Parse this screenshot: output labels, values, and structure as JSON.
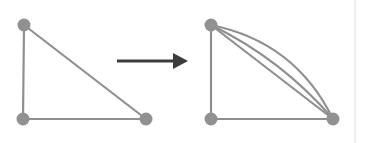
{
  "figure": {
    "background_color": "#ffffff",
    "width": 370,
    "height": 143,
    "edge_color": "#8f8f8f",
    "node_color": "#919191",
    "arrow_color": "#3c3c3c",
    "divider_color": "#f0f0f0",
    "edge_width": 2.2,
    "node_radius": 6.5
  },
  "chart_data": {
    "type": "diagram",
    "panels": [
      {
        "name": "left-graph",
        "label": "simple triangle graph",
        "nodes": [
          {
            "id": "A",
            "name": "top-left-node",
            "x": 24,
            "y": 25,
            "r": 6.5
          },
          {
            "id": "B",
            "name": "bottom-left-node",
            "x": 23,
            "y": 119,
            "r": 6.5
          },
          {
            "id": "C",
            "name": "bottom-right-node",
            "x": 146,
            "y": 119,
            "r": 6.5
          }
        ],
        "edges": [
          {
            "name": "edge-A-B",
            "from": "A",
            "to": "B",
            "kind": "straight",
            "curvature": 0
          },
          {
            "name": "edge-B-C",
            "from": "B",
            "to": "C",
            "kind": "straight",
            "curvature": 0
          },
          {
            "name": "edge-A-C",
            "from": "A",
            "to": "C",
            "kind": "straight",
            "curvature": 0
          }
        ]
      },
      {
        "name": "right-graph",
        "label": "multigraph with three parallel A-C edges",
        "nodes": [
          {
            "id": "A",
            "name": "top-left-node",
            "x": 211,
            "y": 25,
            "r": 6.5
          },
          {
            "id": "B",
            "name": "bottom-left-node",
            "x": 211,
            "y": 119,
            "r": 6.5
          },
          {
            "id": "C",
            "name": "bottom-right-node",
            "x": 333,
            "y": 119,
            "r": 6.5
          }
        ],
        "edges": [
          {
            "name": "edge-A-B",
            "from": "A",
            "to": "B",
            "kind": "straight",
            "curvature": 0
          },
          {
            "name": "edge-B-C",
            "from": "B",
            "to": "C",
            "kind": "straight",
            "curvature": 0
          },
          {
            "name": "edge-A-C-straight",
            "from": "A",
            "to": "C",
            "kind": "straight",
            "curvature": 0
          },
          {
            "name": "edge-A-C-curve-outer",
            "from": "A",
            "to": "C",
            "kind": "curved",
            "curvature": 16
          },
          {
            "name": "edge-A-C-curve-inner",
            "from": "A",
            "to": "C",
            "kind": "curved",
            "curvature": 38
          }
        ]
      }
    ],
    "arrow": {
      "name": "transformation-arrow",
      "direction": "right",
      "x_start": 117,
      "x_end": 188,
      "y": 61,
      "shaft_width": 3,
      "head_length": 15,
      "head_width": 16
    },
    "divider": {
      "name": "right-edge-divider",
      "x": 355,
      "y_start": 0,
      "y_end": 143
    },
    "legend": [],
    "annotations": []
  }
}
